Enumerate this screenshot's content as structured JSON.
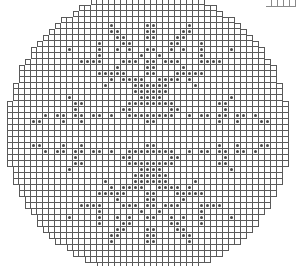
{
  "board": {
    "cell_size": 6,
    "origin_x": 7,
    "origin_y": -1,
    "cols": 48,
    "rows": 45,
    "circle_center": [
      148,
      133
    ],
    "circle_radius": 142,
    "grid_color": "#5a5a5a",
    "dot_color": "#4a4a4a",
    "symmetry": "four-fold (mirror horizontal and vertical)",
    "quadrant_dots": [
      [
        17,
        4
      ],
      [
        17,
        5
      ],
      [
        18,
        5
      ],
      [
        18,
        6
      ],
      [
        19,
        6
      ],
      [
        19,
        7
      ],
      [
        20,
        7
      ],
      [
        20,
        8
      ],
      [
        15,
        7
      ],
      [
        15,
        8
      ],
      [
        15,
        9
      ],
      [
        15,
        10
      ],
      [
        14,
        10
      ],
      [
        13,
        10
      ],
      [
        12,
        10
      ],
      [
        10,
        8
      ],
      [
        18,
        8
      ],
      [
        19,
        10
      ],
      [
        20,
        10
      ],
      [
        21,
        10
      ],
      [
        18,
        11
      ],
      [
        18,
        12
      ],
      [
        19,
        12
      ],
      [
        19,
        13
      ],
      [
        20,
        13
      ],
      [
        21,
        13
      ],
      [
        22,
        13
      ],
      [
        15,
        12
      ],
      [
        16,
        12
      ],
      [
        17,
        12
      ],
      [
        17,
        13
      ],
      [
        16,
        14
      ],
      [
        21,
        14
      ],
      [
        22,
        14
      ],
      [
        23,
        14
      ],
      [
        21,
        15
      ],
      [
        22,
        15
      ],
      [
        23,
        15
      ],
      [
        22,
        16
      ],
      [
        23,
        16
      ],
      [
        10,
        16
      ],
      [
        11,
        17
      ],
      [
        12,
        17
      ],
      [
        11,
        18
      ],
      [
        20,
        17
      ],
      [
        21,
        17
      ],
      [
        22,
        17
      ],
      [
        23,
        17
      ],
      [
        19,
        18
      ],
      [
        20,
        18
      ],
      [
        6,
        19
      ],
      [
        8,
        19
      ],
      [
        9,
        19
      ],
      [
        11,
        19
      ],
      [
        12,
        19
      ],
      [
        14,
        19
      ],
      [
        15,
        19
      ],
      [
        17,
        19
      ],
      [
        4,
        20
      ],
      [
        5,
        20
      ],
      [
        9,
        20
      ],
      [
        12,
        20
      ],
      [
        23,
        20
      ],
      [
        23,
        19
      ],
      [
        22,
        19
      ],
      [
        21,
        19
      ],
      [
        20,
        19
      ],
      [
        23,
        4
      ],
      [
        23,
        5
      ],
      [
        23,
        6
      ],
      [
        23,
        8
      ],
      [
        22,
        9
      ],
      [
        23,
        10
      ],
      [
        23,
        11
      ],
      [
        23,
        12
      ]
    ]
  },
  "corner_fragment": {
    "cells": 5
  }
}
